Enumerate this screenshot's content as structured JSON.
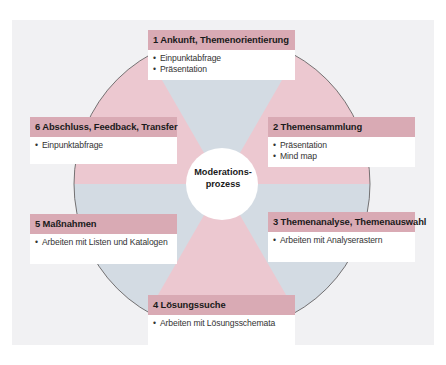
{
  "diagram": {
    "center": {
      "line1": "Moderations-",
      "line2": "prozess"
    },
    "colors": {
      "pink": "#ecc8d0",
      "gray": "#d3dbe3",
      "header": "#d9aab4",
      "panel": "#f1f1f3"
    },
    "steps": [
      {
        "title": "1 Ankunft, Themenorientierung",
        "items": [
          "Einpunktabfrage",
          "Präsentation"
        ]
      },
      {
        "title": "2 Themensammlung",
        "items": [
          "Präsentation",
          "Mind map"
        ]
      },
      {
        "title": "3 Themenanalyse, Themenauswahl",
        "items": [
          "Arbeiten mit Analyserastern"
        ]
      },
      {
        "title": "4 Lösungssuche",
        "items": [
          "Arbeiten mit Lösungsschemata"
        ]
      },
      {
        "title": "5 Maßnahmen",
        "items": [
          "Arbeiten mit Listen und Katalogen"
        ]
      },
      {
        "title": "6 Abschluss, Feedback, Transfer",
        "items": [
          "Einpunktabfrage"
        ]
      }
    ]
  }
}
